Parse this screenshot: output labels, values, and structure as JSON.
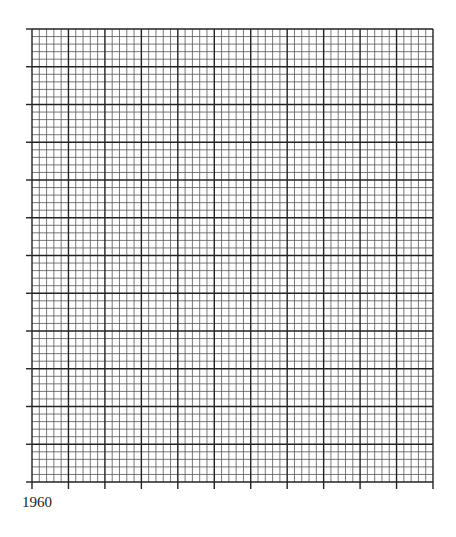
{
  "chart_data": {
    "type": "grid",
    "title": "",
    "xlabel": "",
    "ylabel": "",
    "x_tick_labels": [
      "1960"
    ],
    "grid": true,
    "major_columns": 11,
    "major_rows": 12,
    "minor_per_major": 5,
    "series": [],
    "colors": {
      "major": "#222222",
      "minor": "#555555",
      "background": "#ffffff"
    }
  },
  "axis": {
    "start_label": "1960"
  }
}
